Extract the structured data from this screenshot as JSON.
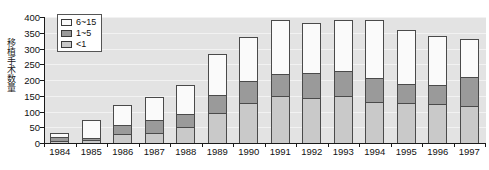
{
  "chart_data": {
    "type": "bar",
    "stacked": true,
    "title": "",
    "xlabel": "",
    "ylabel": "移植手术数量",
    "categories": [
      "1984",
      "1985",
      "1986",
      "1987",
      "1988",
      "1989",
      "1990",
      "1991",
      "1992",
      "1993",
      "1994",
      "1995",
      "1996",
      "1997"
    ],
    "series": [
      {
        "name": "<1",
        "color": "#c9c9c9",
        "values": [
          8,
          10,
          28,
          32,
          53,
          95,
          128,
          150,
          145,
          152,
          130,
          128,
          125,
          120
        ]
      },
      {
        "name": "1~5",
        "color": "#9a9a9a",
        "values": [
          14,
          8,
          32,
          42,
          42,
          58,
          70,
          72,
          80,
          80,
          78,
          60,
          60,
          90
        ]
      },
      {
        "name": "6~15",
        "color": "#fafafa",
        "values": [
          10,
          55,
          62,
          72,
          88,
          130,
          137,
          168,
          155,
          158,
          182,
          172,
          155,
          120
        ]
      }
    ],
    "totals": [
      32,
      73,
      122,
      146,
      183,
      283,
      335,
      390,
      380,
      390,
      390,
      360,
      340,
      330
    ],
    "ylim": [
      0,
      400
    ],
    "yticks": [
      "400",
      "350",
      "300",
      "250",
      "200",
      "150",
      "100",
      "50",
      "0"
    ],
    "ytick_values": [
      400,
      350,
      300,
      250,
      200,
      150,
      100,
      50,
      0
    ],
    "grid": true,
    "legend_position": "top-left",
    "legend": [
      {
        "label": "6~15",
        "color": "#fafafa"
      },
      {
        "label": "1~5",
        "color": "#9a9a9a"
      },
      {
        "label": "<1",
        "color": "#c9c9c9"
      }
    ]
  }
}
